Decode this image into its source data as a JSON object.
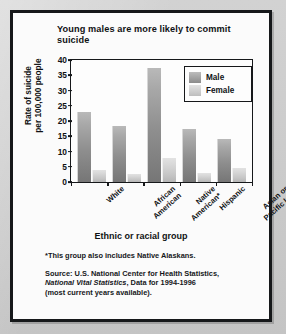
{
  "chart_data": {
    "type": "bar",
    "title": "Young males are more likely to commit suicide",
    "title_line1": "Young males are more likely to",
    "title_line2": "commit suicide",
    "xlabel": "Ethnic or racial group",
    "ylabel": "Rate of suicide per 100,000 people",
    "ylabel_line1": "Rate of suicide",
    "ylabel_line2": "per 100,000 people",
    "ylim": [
      0,
      40
    ],
    "ytick_step": 5,
    "yticks": [
      "40",
      "35",
      "30",
      "25",
      "20",
      "15",
      "10",
      "5",
      "0"
    ],
    "grid": false,
    "legend_position": "top-right",
    "categories": [
      "White",
      "African American",
      "Native American*",
      "Hispanic",
      "Asian or Pacific Isl."
    ],
    "category_lines": [
      [
        "White"
      ],
      [
        "African",
        "American"
      ],
      [
        "Native",
        "American*"
      ],
      [
        "Hispanic"
      ],
      [
        "Asian or",
        "Pacific Isl."
      ]
    ],
    "series": [
      {
        "name": "Male",
        "color": "#8e8e8e",
        "values": [
          23,
          18.5,
          37.5,
          17.5,
          14
        ]
      },
      {
        "name": "Female",
        "color": "#c6c6c6",
        "values": [
          4,
          2.5,
          8,
          3,
          4.5
        ]
      }
    ]
  },
  "notes": {
    "footnote": "*This group also includes Native Alaskans.",
    "source_line1": "Source: U.S. National Center for Health Statistics,",
    "source_italic": "National Vital Statistics",
    "source_line2_rest": ", Data for 1994-1996",
    "source_line3": "(most current years available)."
  },
  "colors": {
    "male": "#8e8e8e",
    "female": "#c6c6c6",
    "ink": "#16181a",
    "card": "#fbfbfb",
    "page": "#c9c9c9"
  }
}
